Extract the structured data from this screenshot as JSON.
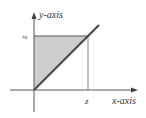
{
  "diagram": {
    "x_axis_label": "x-axis",
    "y_axis_label": "y-axis",
    "x_tick_label": "z",
    "y_tick_label": "z",
    "colors": {
      "line": "#444444",
      "shade": "#c8c8c8",
      "text": "#333333"
    }
  }
}
